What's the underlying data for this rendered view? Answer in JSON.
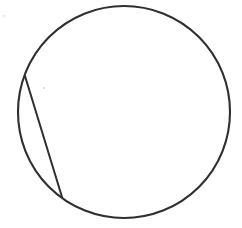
{
  "canvas": {
    "width": 242,
    "height": 228,
    "background_color": "#ffffff",
    "title": "Circle with chord"
  },
  "style": {
    "stroke_color": "#2f2f2f",
    "stroke_width": 2.1,
    "chord_stroke_width": 2.0,
    "speck_color": "#d9d9d9",
    "fill": "none"
  },
  "chart_data": {
    "type": "diagram",
    "title": "",
    "subtitle": "",
    "xlabel": "",
    "ylabel": "",
    "legend": [],
    "annotations": [],
    "grid": false,
    "shapes": [
      {
        "name": "circle",
        "type": "ellipse",
        "cx": 124,
        "cy": 112,
        "rx": 106,
        "ry": 106,
        "stroke": "#2f2f2f",
        "stroke_width": 2.1,
        "fill": "none"
      },
      {
        "name": "chord",
        "type": "line",
        "x1": 25,
        "y1": 76,
        "x2": 62,
        "y2": 197,
        "stroke": "#2f2f2f",
        "stroke_width": 2.0
      },
      {
        "name": "speck",
        "type": "dot",
        "cx": 44,
        "cy": 88,
        "r": 1.1,
        "fill": "#d9d9d9"
      }
    ],
    "derived": {
      "chord_length": 126.5,
      "segment_side": "left",
      "circle_diameter": 212
    }
  },
  "labels": {
    "caption": "Circle with a chord cutting a thin segment from the left side"
  }
}
